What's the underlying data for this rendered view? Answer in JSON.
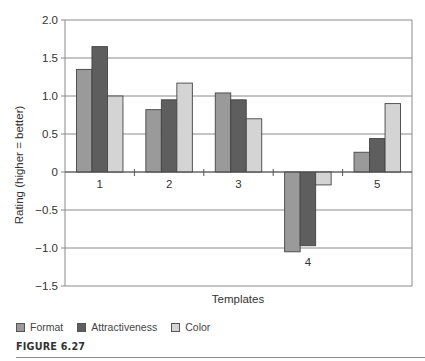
{
  "chart_data": {
    "type": "bar",
    "title": "",
    "xlabel": "Templates",
    "ylabel": "Rating (higher = better)",
    "categories": [
      "1",
      "2",
      "3",
      "4",
      "5"
    ],
    "series": [
      {
        "name": "Format",
        "color": "#9a9a9a",
        "values": [
          1.35,
          0.82,
          1.04,
          -1.05,
          0.26
        ]
      },
      {
        "name": "Attractiveness",
        "color": "#5e5e5e",
        "values": [
          1.65,
          0.95,
          0.95,
          -0.97,
          0.44
        ]
      },
      {
        "name": "Color",
        "color": "#d4d4d4",
        "values": [
          1.0,
          1.17,
          0.7,
          -0.17,
          0.9
        ]
      }
    ],
    "ylim": [
      -1.5,
      2.0
    ],
    "yticks": [
      "2.0",
      "1.5",
      "1.0",
      "0.5",
      "0",
      "-0.5",
      "-1.0",
      "-1.5"
    ],
    "ytick_values": [
      2.0,
      1.5,
      1.0,
      0.5,
      0,
      -0.5,
      -1.0,
      -1.5
    ],
    "grid": true,
    "legend_position": "bottom-left"
  },
  "legend": {
    "items": [
      {
        "label": "Format",
        "color": "#9a9a9a"
      },
      {
        "label": "Attractiveness",
        "color": "#5e5e5e"
      },
      {
        "label": "Color",
        "color": "#d4d4d4"
      }
    ]
  },
  "figure": {
    "caption": "FIGURE 6.27"
  }
}
